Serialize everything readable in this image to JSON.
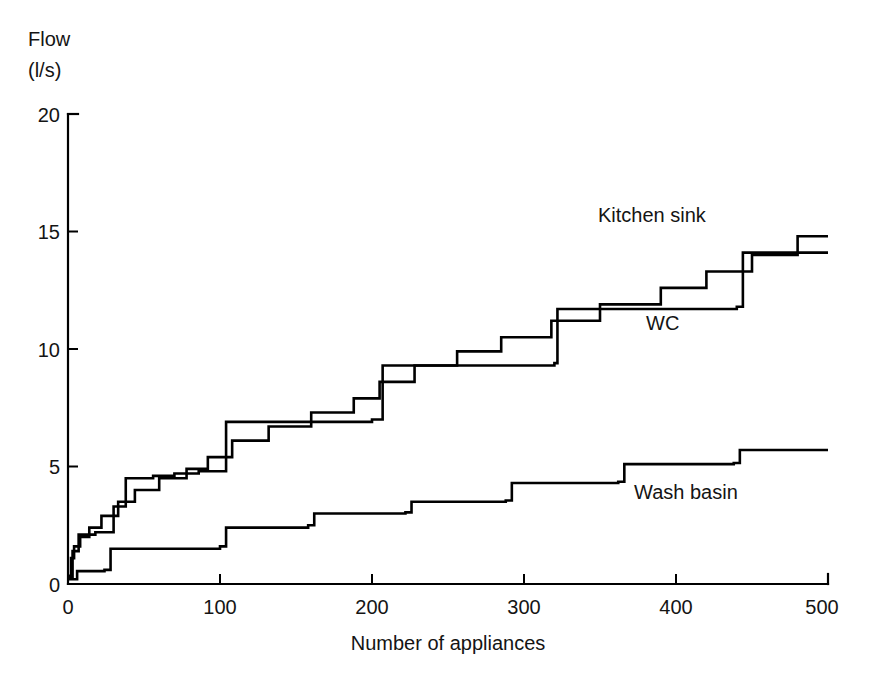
{
  "chart_data": {
    "type": "line",
    "subtype": "step",
    "title": "",
    "xlabel": "Number of appliances",
    "ylabel": "Flow (l/s)",
    "ylabel_line1": "Flow",
    "ylabel_line2": "(l/s)",
    "xlim": [
      0,
      500
    ],
    "ylim": [
      0,
      20
    ],
    "xticks": [
      0,
      100,
      200,
      300,
      400,
      500
    ],
    "yticks": [
      0,
      5,
      10,
      15,
      20
    ],
    "xtick_labels": [
      "0",
      "100",
      "200",
      "300",
      "400",
      "500"
    ],
    "ytick_labels": [
      "0",
      "5",
      "10",
      "15",
      "20"
    ],
    "grid": false,
    "legend_position": "inline-annotation",
    "line_color": "#000000",
    "series": [
      {
        "name": "Kitchen sink",
        "label": "Kitchen sink",
        "label_x": 340,
        "label_y": 15.8,
        "steps": [
          [
            0,
            0.35
          ],
          [
            2,
            1.1
          ],
          [
            4,
            1.6
          ],
          [
            8,
            2.0
          ],
          [
            14,
            2.4
          ],
          [
            22,
            2.9
          ],
          [
            33,
            3.5
          ],
          [
            44,
            4.0
          ],
          [
            60,
            4.5
          ],
          [
            78,
            4.9
          ],
          [
            92,
            5.4
          ],
          [
            108,
            6.1
          ],
          [
            132,
            6.7
          ],
          [
            160,
            7.3
          ],
          [
            188,
            7.9
          ],
          [
            205,
            8.6
          ],
          [
            228,
            9.3
          ],
          [
            256,
            9.9
          ],
          [
            285,
            10.5
          ],
          [
            318,
            11.2
          ],
          [
            350,
            11.9
          ],
          [
            390,
            12.6
          ],
          [
            420,
            13.3
          ],
          [
            450,
            14.0
          ],
          [
            480,
            14.8
          ],
          [
            500,
            14.8
          ]
        ]
      },
      {
        "name": "WC",
        "label": "WC",
        "label_x": 385,
        "label_y": 11.0,
        "steps": [
          [
            0,
            0.3
          ],
          [
            3,
            1.4
          ],
          [
            7,
            2.1
          ],
          [
            18,
            2.2
          ],
          [
            30,
            3.3
          ],
          [
            38,
            4.5
          ],
          [
            56,
            4.6
          ],
          [
            70,
            4.7
          ],
          [
            86,
            4.8
          ],
          [
            104,
            6.9
          ],
          [
            200,
            7.0
          ],
          [
            207,
            9.3
          ],
          [
            320,
            9.4
          ],
          [
            322,
            11.7
          ],
          [
            440,
            11.8
          ],
          [
            444,
            14.1
          ],
          [
            500,
            14.1
          ]
        ]
      },
      {
        "name": "Wash basin",
        "label": "Wash basin",
        "label_x": 375,
        "label_y": 4.1,
        "steps": [
          [
            0,
            0.2
          ],
          [
            6,
            0.55
          ],
          [
            24,
            0.6
          ],
          [
            28,
            1.5
          ],
          [
            100,
            1.6
          ],
          [
            104,
            2.4
          ],
          [
            158,
            2.5
          ],
          [
            162,
            3.0
          ],
          [
            222,
            3.05
          ],
          [
            226,
            3.5
          ],
          [
            288,
            3.55
          ],
          [
            292,
            4.3
          ],
          [
            362,
            4.35
          ],
          [
            366,
            5.1
          ],
          [
            438,
            5.15
          ],
          [
            442,
            5.7
          ],
          [
            500,
            5.7
          ]
        ]
      }
    ],
    "kitchen_sink_detail": {
      "description": "Upper staircase rising from ~0.3 l/s at 0 appliances to ~17.3 l/s at 500 appliances"
    },
    "wc_detail": {
      "description": "Middle staircase with large jumps at ~320 and ~443 appliances, ending at ~14.1 l/s"
    },
    "wash_basin_detail": {
      "description": "Lower staircase rising from ~0.2 l/s to ~5.7 l/s at 500 appliances"
    }
  },
  "axes": {
    "x_title": "Number of appliances",
    "y_title_line1": "Flow",
    "y_title_line2": "(l/s)"
  }
}
